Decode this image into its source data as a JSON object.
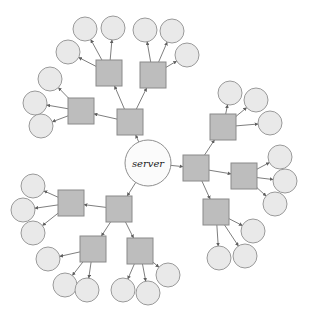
{
  "diagram": {
    "type": "node-link-diagram",
    "canvas": {
      "width": 318,
      "height": 327,
      "background": "#ffffff"
    },
    "style": {
      "square_fill": "#bdbdbd",
      "square_stroke": "#8a8a8a",
      "circle_fill": "#e9e9e9",
      "circle_stroke": "#9a9a9a",
      "server_fill": "#fbfbfb",
      "server_stroke": "#8f8f8f",
      "edge_color": "#6f6f6f",
      "edge_arrow": "double-headed",
      "square_size": 26,
      "circle_radius": 12,
      "server_radius": 23
    },
    "server": {
      "id": "server",
      "label": "server",
      "shape": "circle",
      "x": 148,
      "y": 163,
      "r": 23
    },
    "squares": [
      {
        "id": "s_tl_hub",
        "x": 130,
        "y": 122,
        "cluster": "top-left",
        "role": "cluster-hub"
      },
      {
        "id": "s_tl_a",
        "x": 109,
        "y": 73,
        "cluster": "top-left",
        "role": "branch"
      },
      {
        "id": "s_tl_b",
        "x": 153,
        "y": 75,
        "cluster": "top-left",
        "role": "branch"
      },
      {
        "id": "s_tl_c",
        "x": 81,
        "y": 111,
        "cluster": "top-left",
        "role": "branch"
      },
      {
        "id": "s_r_hub",
        "x": 196,
        "y": 168,
        "cluster": "right",
        "role": "cluster-hub"
      },
      {
        "id": "s_r_a",
        "x": 223,
        "y": 127,
        "cluster": "right",
        "role": "branch"
      },
      {
        "id": "s_r_b",
        "x": 244,
        "y": 176,
        "cluster": "right",
        "role": "branch"
      },
      {
        "id": "s_r_c",
        "x": 216,
        "y": 212,
        "cluster": "right",
        "role": "branch"
      },
      {
        "id": "s_bl_hub",
        "x": 119,
        "y": 209,
        "cluster": "bottom-left",
        "role": "cluster-hub"
      },
      {
        "id": "s_bl_a",
        "x": 71,
        "y": 203,
        "cluster": "bottom-left",
        "role": "branch"
      },
      {
        "id": "s_bl_b",
        "x": 93,
        "y": 249,
        "cluster": "bottom-left",
        "role": "branch"
      },
      {
        "id": "s_bl_c",
        "x": 140,
        "y": 251,
        "cluster": "bottom-left",
        "role": "branch"
      }
    ],
    "circles": [
      {
        "id": "c1",
        "x": 85,
        "y": 29,
        "parent": "s_tl_a"
      },
      {
        "id": "c2",
        "x": 113,
        "y": 28,
        "parent": "s_tl_a"
      },
      {
        "id": "c3",
        "x": 68,
        "y": 52,
        "parent": "s_tl_a"
      },
      {
        "id": "c4",
        "x": 145,
        "y": 30,
        "parent": "s_tl_b"
      },
      {
        "id": "c5",
        "x": 172,
        "y": 31,
        "parent": "s_tl_b"
      },
      {
        "id": "c6",
        "x": 187,
        "y": 55,
        "parent": "s_tl_b"
      },
      {
        "id": "c7",
        "x": 50,
        "y": 79,
        "parent": "s_tl_c"
      },
      {
        "id": "c8",
        "x": 35,
        "y": 103,
        "parent": "s_tl_c"
      },
      {
        "id": "c9",
        "x": 41,
        "y": 126,
        "parent": "s_tl_c"
      },
      {
        "id": "c10",
        "x": 230,
        "y": 93,
        "parent": "s_r_a"
      },
      {
        "id": "c11",
        "x": 256,
        "y": 100,
        "parent": "s_r_a"
      },
      {
        "id": "c12",
        "x": 270,
        "y": 123,
        "parent": "s_r_a"
      },
      {
        "id": "c13",
        "x": 280,
        "y": 157,
        "parent": "s_r_b"
      },
      {
        "id": "c14",
        "x": 285,
        "y": 181,
        "parent": "s_r_b"
      },
      {
        "id": "c15",
        "x": 275,
        "y": 204,
        "parent": "s_r_b"
      },
      {
        "id": "c16",
        "x": 253,
        "y": 231,
        "parent": "s_r_c"
      },
      {
        "id": "c17",
        "x": 245,
        "y": 256,
        "parent": "s_r_c"
      },
      {
        "id": "c18",
        "x": 219,
        "y": 258,
        "parent": "s_r_c"
      },
      {
        "id": "c19",
        "x": 33,
        "y": 186,
        "parent": "s_bl_a"
      },
      {
        "id": "c20",
        "x": 23,
        "y": 210,
        "parent": "s_bl_a"
      },
      {
        "id": "c21",
        "x": 33,
        "y": 233,
        "parent": "s_bl_a"
      },
      {
        "id": "c22",
        "x": 48,
        "y": 259,
        "parent": "s_bl_b"
      },
      {
        "id": "c23",
        "x": 65,
        "y": 285,
        "parent": "s_bl_b"
      },
      {
        "id": "c24",
        "x": 87,
        "y": 290,
        "parent": "s_bl_b"
      },
      {
        "id": "c25",
        "x": 123,
        "y": 290,
        "parent": "s_bl_c"
      },
      {
        "id": "c26",
        "x": 148,
        "y": 293,
        "parent": "s_bl_c"
      },
      {
        "id": "c27",
        "x": 168,
        "y": 275,
        "parent": "s_bl_c"
      }
    ],
    "edges": [
      {
        "from": "server",
        "to": "s_tl_hub"
      },
      {
        "from": "server",
        "to": "s_r_hub"
      },
      {
        "from": "server",
        "to": "s_bl_hub"
      },
      {
        "from": "s_tl_hub",
        "to": "s_tl_a"
      },
      {
        "from": "s_tl_hub",
        "to": "s_tl_b"
      },
      {
        "from": "s_tl_hub",
        "to": "s_tl_c"
      },
      {
        "from": "s_tl_a",
        "to": "c1"
      },
      {
        "from": "s_tl_a",
        "to": "c2"
      },
      {
        "from": "s_tl_a",
        "to": "c3"
      },
      {
        "from": "s_tl_b",
        "to": "c4"
      },
      {
        "from": "s_tl_b",
        "to": "c5"
      },
      {
        "from": "s_tl_b",
        "to": "c6"
      },
      {
        "from": "s_tl_c",
        "to": "c7"
      },
      {
        "from": "s_tl_c",
        "to": "c8"
      },
      {
        "from": "s_tl_c",
        "to": "c9"
      },
      {
        "from": "s_r_hub",
        "to": "s_r_a"
      },
      {
        "from": "s_r_hub",
        "to": "s_r_b"
      },
      {
        "from": "s_r_hub",
        "to": "s_r_c"
      },
      {
        "from": "s_r_a",
        "to": "c10"
      },
      {
        "from": "s_r_a",
        "to": "c11"
      },
      {
        "from": "s_r_a",
        "to": "c12"
      },
      {
        "from": "s_r_b",
        "to": "c13"
      },
      {
        "from": "s_r_b",
        "to": "c14"
      },
      {
        "from": "s_r_b",
        "to": "c15"
      },
      {
        "from": "s_r_c",
        "to": "c16"
      },
      {
        "from": "s_r_c",
        "to": "c17"
      },
      {
        "from": "s_r_c",
        "to": "c18"
      },
      {
        "from": "s_bl_hub",
        "to": "s_bl_a"
      },
      {
        "from": "s_bl_hub",
        "to": "s_bl_b"
      },
      {
        "from": "s_bl_hub",
        "to": "s_bl_c"
      },
      {
        "from": "s_bl_a",
        "to": "c19"
      },
      {
        "from": "s_bl_a",
        "to": "c20"
      },
      {
        "from": "s_bl_a",
        "to": "c21"
      },
      {
        "from": "s_bl_b",
        "to": "c22"
      },
      {
        "from": "s_bl_b",
        "to": "c23"
      },
      {
        "from": "s_bl_b",
        "to": "c24"
      },
      {
        "from": "s_bl_c",
        "to": "c25"
      },
      {
        "from": "s_bl_c",
        "to": "c26"
      },
      {
        "from": "s_bl_c",
        "to": "c27"
      }
    ]
  }
}
